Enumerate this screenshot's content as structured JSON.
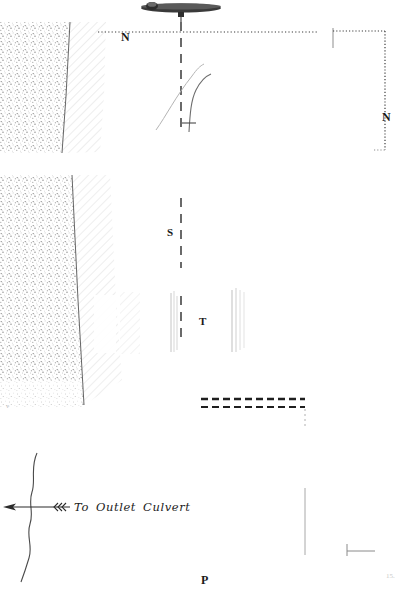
{
  "sheet": {
    "width": 403,
    "height": 589,
    "background": "#ffffff",
    "ink": "#1a1a1a",
    "faint_ink": "#c9c9c9",
    "title": "Survey plan sheet — outlet culvert and embankment"
  },
  "labels": {
    "n_left": "N",
    "n_right": "N",
    "s": "S",
    "t": "T",
    "p": "P",
    "corner_mark": "15."
  },
  "annotation": {
    "to": "To",
    "outlet": "Outlet",
    "culvert": "Culvert",
    "full_text": "To Outlet Culvert"
  },
  "features": {
    "weir_structure": "weir-structure-symbol",
    "centerline": "section-centerline-dashed",
    "station_line_n": "station-line-n-dotted",
    "embankment_stipple": "embankment-stipple-fill",
    "embankment_hatch": "embankment-diagonal-hatch",
    "boundary_box": "dotted-boundary-box",
    "channel_dashed": "channel-dashed-pair",
    "stream_line": "meandering-stream-line",
    "flow_arrow": "flow-direction-arrow",
    "flow_chevrons": "flow-chevrons",
    "contour_curves": "contour-curve-pair",
    "scale_tick": "scale-tick-mark"
  }
}
